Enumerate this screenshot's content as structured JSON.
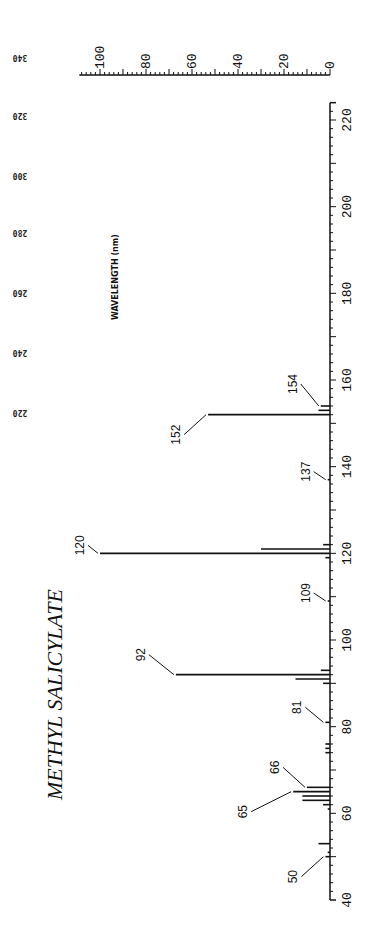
{
  "chart_data": {
    "type": "bar",
    "title": "METHYL SALICYLATE",
    "orientation": "rotated 90deg (m/z axis vertical, intensity axis horizontal at top)",
    "xlabel": "m/z",
    "ylabel": "Relative Intensity",
    "xlim": [
      40,
      230
    ],
    "ylim": [
      0,
      100
    ],
    "x_ticks": [
      40,
      60,
      80,
      100,
      120,
      140,
      160,
      180,
      200,
      220
    ],
    "y_ticks": [
      0,
      20,
      40,
      60,
      80,
      100
    ],
    "secondary_axis_label": "WAVELENGTH (nm)",
    "secondary_axis_ticks": [
      220,
      240,
      260,
      280,
      300,
      320,
      340
    ],
    "annotated_peaks": [
      50,
      65,
      66,
      81,
      92,
      109,
      120,
      137,
      152,
      154
    ],
    "peaks": [
      {
        "mz": 50,
        "intensity": 2
      },
      {
        "mz": 51,
        "intensity": 1
      },
      {
        "mz": 53,
        "intensity": 5
      },
      {
        "mz": 61,
        "intensity": 1
      },
      {
        "mz": 62,
        "intensity": 3
      },
      {
        "mz": 63,
        "intensity": 12
      },
      {
        "mz": 64,
        "intensity": 12
      },
      {
        "mz": 65,
        "intensity": 16
      },
      {
        "mz": 66,
        "intensity": 10
      },
      {
        "mz": 74,
        "intensity": 2
      },
      {
        "mz": 75,
        "intensity": 2
      },
      {
        "mz": 76,
        "intensity": 2
      },
      {
        "mz": 81,
        "intensity": 2
      },
      {
        "mz": 90,
        "intensity": 3
      },
      {
        "mz": 91,
        "intensity": 15
      },
      {
        "mz": 92,
        "intensity": 67
      },
      {
        "mz": 93,
        "intensity": 4
      },
      {
        "mz": 109,
        "intensity": 1
      },
      {
        "mz": 119,
        "intensity": 2
      },
      {
        "mz": 120,
        "intensity": 100
      },
      {
        "mz": 121,
        "intensity": 30
      },
      {
        "mz": 122,
        "intensity": 3
      },
      {
        "mz": 137,
        "intensity": 1
      },
      {
        "mz": 152,
        "intensity": 53
      },
      {
        "mz": 153,
        "intensity": 5
      },
      {
        "mz": 154,
        "intensity": 4
      }
    ],
    "grid": false,
    "legend": null
  }
}
